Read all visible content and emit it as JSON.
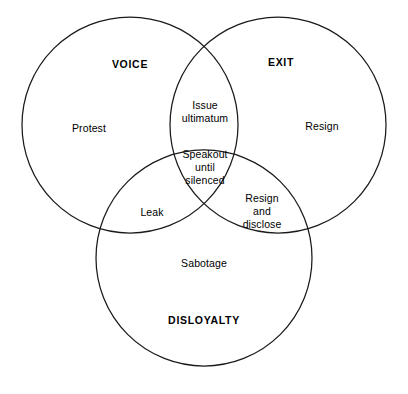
{
  "diagram": {
    "type": "venn-3-set",
    "title_text": "",
    "stroke_color": "#1a1a1a",
    "fill_color": "none",
    "background_color": "#ffffff",
    "sets": [
      {
        "id": "voice",
        "title": "VOICE",
        "title_x": 130,
        "title_y": 64,
        "circle": {
          "cx": 130,
          "cy": 125,
          "r": 108
        }
      },
      {
        "id": "exit",
        "title": "EXIT",
        "title_x": 281,
        "title_y": 62,
        "circle": {
          "cx": 278,
          "cy": 125,
          "r": 108
        }
      },
      {
        "id": "disloyalty",
        "title": "DISLOYALTY",
        "title_x": 204,
        "title_y": 320,
        "circle": {
          "cx": 204,
          "cy": 258,
          "r": 108
        }
      }
    ],
    "regions": [
      {
        "id": "voice-only",
        "label": "Protest",
        "sets": [
          "voice"
        ],
        "x": 89,
        "y": 128
      },
      {
        "id": "exit-only",
        "label": "Resign",
        "sets": [
          "exit"
        ],
        "x": 322,
        "y": 126
      },
      {
        "id": "disloyalty-only",
        "label": "Sabotage",
        "sets": [
          "disloyalty"
        ],
        "x": 204,
        "y": 263
      },
      {
        "id": "voice-exit",
        "label": "Issue\nultimatum",
        "sets": [
          "voice",
          "exit"
        ],
        "x": 205,
        "y": 112
      },
      {
        "id": "voice-disloyalty",
        "label": "Leak",
        "sets": [
          "voice",
          "disloyalty"
        ],
        "x": 152,
        "y": 212
      },
      {
        "id": "exit-disloyalty",
        "label": "Resign\nand\ndisclose",
        "sets": [
          "exit",
          "disloyalty"
        ],
        "x": 262,
        "y": 211
      },
      {
        "id": "voice-exit-disloyalty",
        "label": "Speakout\nuntil\nsilenced",
        "sets": [
          "voice",
          "exit",
          "disloyalty"
        ],
        "x": 205,
        "y": 167
      }
    ]
  }
}
